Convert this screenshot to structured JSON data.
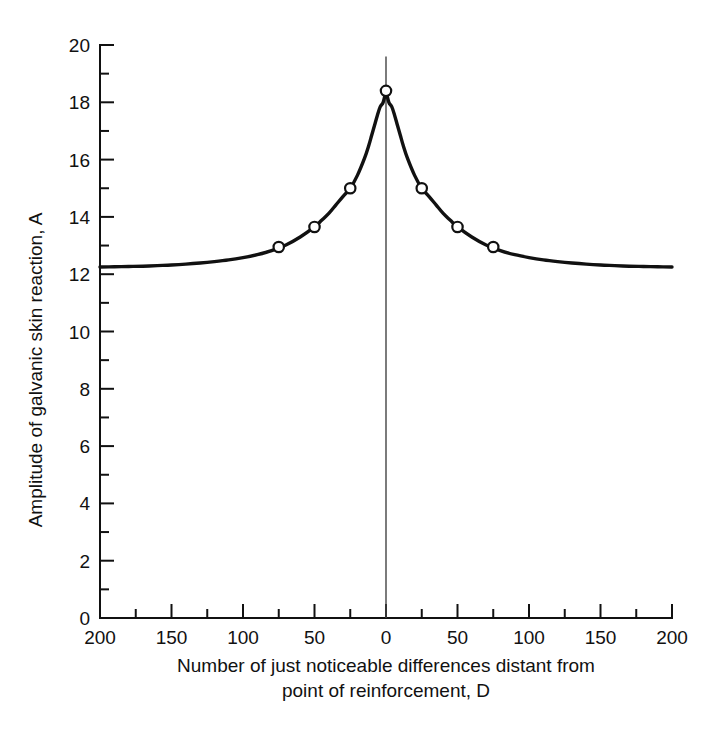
{
  "chart_data": {
    "type": "line",
    "title": "",
    "xlabel": "Number of just noticeable differences distant from point of reinforcement, D",
    "ylabel": "Amplitude of galvanic skin reaction, A",
    "xlabel_line1": "Number of just noticeable differences distant from",
    "xlabel_line2": "point of reinforcement,  D",
    "xlim": [
      -200,
      200
    ],
    "ylim": [
      0,
      20
    ],
    "grid": false,
    "legend": null,
    "x_major_ticks": [
      -200,
      -150,
      -100,
      -50,
      0,
      50,
      100,
      150,
      200
    ],
    "x_major_tick_labels": [
      "200",
      "150",
      "100",
      "50",
      "0",
      "50",
      "100",
      "150",
      "200"
    ],
    "x_minor_ticks": [
      -175,
      -125,
      -75,
      -25,
      25,
      75,
      125,
      175
    ],
    "y_major_ticks": [
      0,
      2,
      4,
      6,
      8,
      10,
      12,
      14,
      16,
      18,
      20
    ],
    "y_major_tick_labels": [
      "0",
      "2",
      "4",
      "6",
      "8",
      "10",
      "12",
      "14",
      "16",
      "18",
      "20"
    ],
    "y_minor_ticks": [
      1,
      3,
      5,
      7,
      9,
      11,
      13,
      15,
      17,
      19
    ],
    "series": [
      {
        "name": "Generalization gradient",
        "marker": "open-circle",
        "marker_points_x": [
          -75,
          -50,
          -25,
          0,
          25,
          50,
          75
        ],
        "marker_points_y": [
          12.95,
          13.65,
          15.0,
          18.4,
          15.0,
          13.65,
          12.95
        ],
        "curve_x": [
          -200,
          -190,
          -180,
          -170,
          -160,
          -150,
          -140,
          -130,
          -120,
          -110,
          -100,
          -90,
          -80,
          -75,
          -70,
          -60,
          -50,
          -45,
          -40,
          -35,
          -30,
          -25,
          -20,
          -15,
          -12,
          -10,
          -8,
          -6,
          -4,
          -2,
          0,
          2,
          4,
          6,
          8,
          10,
          12,
          15,
          20,
          25,
          30,
          35,
          40,
          45,
          50,
          60,
          70,
          75,
          80,
          90,
          100,
          110,
          120,
          130,
          140,
          150,
          160,
          170,
          180,
          190,
          200
        ],
        "curve_y": [
          12.25,
          12.26,
          12.27,
          12.28,
          12.3,
          12.32,
          12.35,
          12.39,
          12.44,
          12.5,
          12.58,
          12.68,
          12.82,
          12.95,
          13.02,
          13.3,
          13.65,
          13.88,
          14.12,
          14.42,
          14.72,
          15.0,
          15.45,
          16.05,
          16.5,
          16.85,
          17.2,
          17.55,
          17.85,
          18.0,
          18.4,
          18.0,
          17.85,
          17.55,
          17.2,
          16.85,
          16.5,
          16.05,
          15.45,
          15.0,
          14.72,
          14.42,
          14.12,
          13.88,
          13.65,
          13.3,
          13.02,
          12.95,
          12.82,
          12.68,
          12.58,
          12.5,
          12.44,
          12.39,
          12.35,
          12.32,
          12.3,
          12.28,
          12.27,
          12.26,
          12.25
        ]
      }
    ],
    "baseline_asymptote": 12.25,
    "peak_value": 18.4,
    "peak_x": 0,
    "center_reference_line_x": 0,
    "colors": {
      "curve": "#111111",
      "axis": "#111111",
      "marker_fill": "#ffffff",
      "background": "#ffffff",
      "center_line": "#444444"
    }
  }
}
